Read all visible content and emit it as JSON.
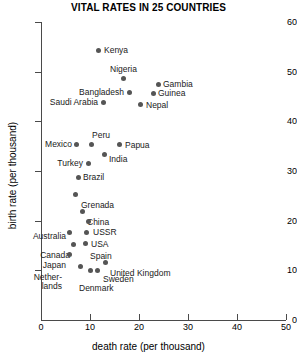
{
  "chart_data": {
    "type": "scatter",
    "title": "VITAL RATES IN 25 COUNTRIES",
    "xlabel": "death rate (per thousand)",
    "ylabel": "birth rate (per thousand)",
    "xlim": [
      0,
      50
    ],
    "ylim": [
      0,
      60
    ],
    "xticks": [
      0,
      10,
      20,
      30,
      40,
      50
    ],
    "yticks": [
      0,
      10,
      20,
      30,
      40,
      50,
      60
    ],
    "grid": false,
    "legend": "none",
    "point_color": "#555555",
    "points": [
      {
        "label": "Kenya",
        "x": 11.8,
        "y": 54.3,
        "lx": 104,
        "ly": 46,
        "side": "right"
      },
      {
        "label": "Nigeria",
        "x": 16.9,
        "y": 48.7,
        "lx": 110,
        "ly": 65,
        "side": "above"
      },
      {
        "label": "Gambia",
        "x": 23.9,
        "y": 47.5,
        "lx": 163,
        "ly": 80,
        "side": "right"
      },
      {
        "label": "Bangladesh",
        "x": 18.0,
        "y": 45.9,
        "lx": 124,
        "ly": 88,
        "side": "left"
      },
      {
        "label": "Guinea",
        "x": 22.9,
        "y": 45.7,
        "lx": 158,
        "ly": 89,
        "side": "right"
      },
      {
        "label": "Saudi Arabia",
        "x": 12.7,
        "y": 43.8,
        "lx": 98,
        "ly": 98,
        "side": "left"
      },
      {
        "label": "Nepal",
        "x": 20.4,
        "y": 43.4,
        "lx": 146,
        "ly": 101,
        "side": "right"
      },
      {
        "label": "Peru",
        "x": 10.4,
        "y": 35.4,
        "lx": 92,
        "ly": 131,
        "side": "above"
      },
      {
        "label": "Mexico",
        "x": 7.3,
        "y": 35.4,
        "lx": 72,
        "ly": 140,
        "side": "left"
      },
      {
        "label": "Papua",
        "x": 16.1,
        "y": 35.4,
        "lx": 125,
        "ly": 141,
        "side": "right"
      },
      {
        "label": "India",
        "x": 12.9,
        "y": 33.3,
        "lx": 109,
        "ly": 155,
        "side": "right"
      },
      {
        "label": "Turkey",
        "x": 9.6,
        "y": 31.5,
        "lx": 83,
        "ly": 159,
        "side": "left"
      },
      {
        "label": "Brazil",
        "x": 7.6,
        "y": 28.7,
        "lx": 83,
        "ly": 173,
        "side": "right"
      },
      {
        "label": "Grenada",
        "x": 7.1,
        "y": 25.3,
        "lx": 81,
        "ly": 201,
        "side": "right"
      },
      {
        "label": "China",
        "x": 8.4,
        "y": 21.8,
        "lx": 87,
        "ly": 218,
        "side": "right"
      },
      {
        "label": "USSR",
        "x": 9.6,
        "y": 19.8,
        "lx": 93,
        "ly": 228,
        "side": "right"
      },
      {
        "label": "USA",
        "x": 9.2,
        "y": 17.6,
        "lx": 91,
        "ly": 240,
        "side": "right"
      },
      {
        "label": "Australia",
        "x": 5.9,
        "y": 17.6,
        "lx": 66,
        "ly": 232,
        "side": "left"
      },
      {
        "label": "Spain",
        "x": 9.0,
        "y": 15.4,
        "lx": 90,
        "ly": 252,
        "side": "right"
      },
      {
        "label": "Canada",
        "x": 6.7,
        "y": 15.2,
        "lx": 70,
        "ly": 251,
        "side": "left"
      },
      {
        "label": "Japan",
        "x": 5.9,
        "y": 13.2,
        "lx": 66,
        "ly": 261,
        "side": "left"
      },
      {
        "label": "United Kingdom",
        "x": 13.1,
        "y": 11.6,
        "lx": 110,
        "ly": 269,
        "side": "right"
      },
      {
        "label": "Nether-\nlands",
        "x": 8.0,
        "y": 10.7,
        "lx": 62,
        "ly": 273,
        "side": "left"
      },
      {
        "label": "Sweden",
        "x": 11.6,
        "y": 10.0,
        "lx": 103,
        "ly": 275,
        "side": "right"
      },
      {
        "label": "Denmark",
        "x": 10.2,
        "y": 9.9,
        "lx": 79,
        "ly": 284,
        "side": "below"
      }
    ]
  }
}
